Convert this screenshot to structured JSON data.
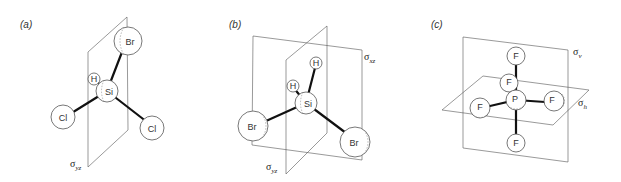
{
  "panels": [
    {
      "label": "(a)",
      "molecule": "SiH Br Cl2",
      "atoms": {
        "br": "Br",
        "h": "H",
        "si": "Si",
        "cl1": "Cl",
        "cl2": "Cl"
      },
      "planes": [
        {
          "symbol": "σ",
          "subscript": "yz"
        }
      ]
    },
    {
      "label": "(b)",
      "molecule": "SiH2Br2",
      "atoms": {
        "h1": "H",
        "h2": "H",
        "si": "Si",
        "br1": "Br",
        "br2": "Br"
      },
      "planes": [
        {
          "symbol": "σ",
          "subscript": "xz"
        },
        {
          "symbol": "σ",
          "subscript": "yz"
        }
      ]
    },
    {
      "label": "(c)",
      "molecule": "PF5",
      "atoms": {
        "p": "P",
        "f_top": "F",
        "f_bottom": "F",
        "f_left": "F",
        "f_right": "F",
        "f_back": "F"
      },
      "planes": [
        {
          "symbol": "σ",
          "subscript": "v"
        },
        {
          "symbol": "σ",
          "subscript": "h"
        }
      ]
    }
  ]
}
